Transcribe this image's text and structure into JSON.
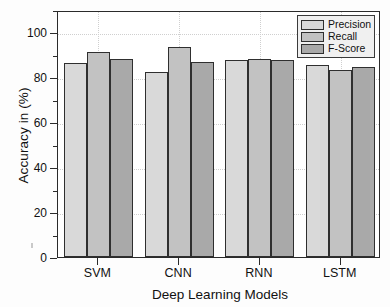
{
  "chart_data": {
    "type": "bar",
    "title": "",
    "xlabel": "Deep Learning Models",
    "ylabel": "Accuracy in (%)",
    "categories": [
      "SVM",
      "CNN",
      "RNN",
      "LSTM"
    ],
    "series": [
      {
        "name": "Precision",
        "color": "#d9d9d9",
        "values": [
          86.3,
          82.4,
          87.6,
          85.6
        ]
      },
      {
        "name": "Recall",
        "color": "#c2c2c2",
        "values": [
          91.2,
          93.4,
          88.3,
          83.4
        ]
      },
      {
        "name": "F-Score",
        "color": "#a9a9a9",
        "values": [
          88.3,
          86.9,
          87.9,
          84.7
        ]
      }
    ],
    "ylim": [
      0,
      110
    ],
    "ytick_labels": [
      "0",
      "20",
      "40",
      "60",
      "80",
      "100"
    ],
    "ytick_values": [
      0,
      20,
      40,
      60,
      80,
      100
    ],
    "yminor_values": [
      10,
      30,
      50,
      70,
      90,
      110
    ],
    "grid": "dotted",
    "legend_position": "top-right",
    "legend_entries": [
      "Precision",
      "Recall",
      "F-Score"
    ]
  },
  "axes": {
    "y_title": "Accuracy in (%)",
    "x_title": "Deep Learning Models"
  }
}
